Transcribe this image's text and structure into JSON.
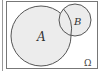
{
  "diagram": {
    "type": "venn",
    "universe_label": "Ω",
    "sets": [
      {
        "name": "A",
        "label": "A"
      },
      {
        "name": "B",
        "label": "B"
      }
    ],
    "colors": {
      "fill": "#ececec",
      "stroke": "#555555",
      "frame": "#777777",
      "background": "#ffffff"
    }
  }
}
